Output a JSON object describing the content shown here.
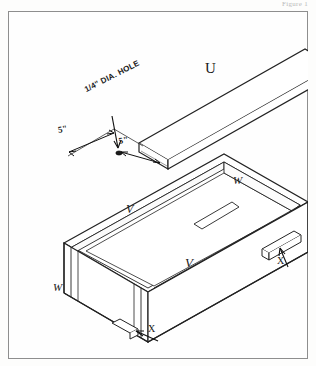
{
  "figure": {
    "caption": "Figure 1"
  },
  "drawing": {
    "title": "Exploded isometric view of wooden box with lid",
    "parts": {
      "lid": "U",
      "side_panel_back": "V",
      "side_panel_front": "V",
      "end_panel_right": "W",
      "end_panel_left": "W",
      "cleat_right": "X",
      "cleat_front": "X"
    },
    "annotations": {
      "hole_note": "1/4\" DIA. HOLE",
      "dim_left": "5\"",
      "dim_right": "5\""
    }
  },
  "colors": {
    "ink": "#1a1a1a",
    "line": "#222222",
    "border": "#8e8e8e",
    "paper": "#fefefe",
    "caption": "#b9b9b9"
  }
}
